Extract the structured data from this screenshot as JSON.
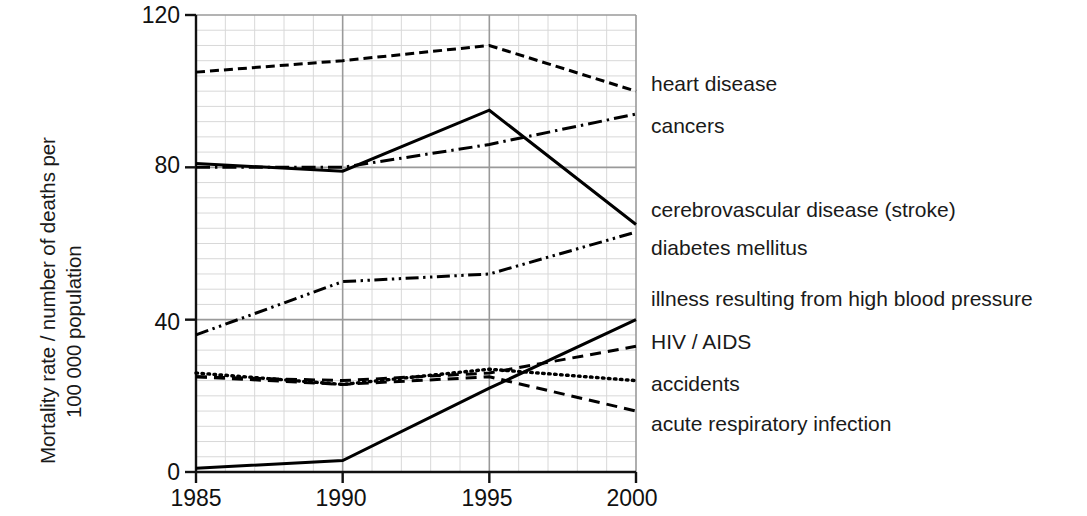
{
  "axes": {
    "ylabel_line1": "Mortality rate / number of deaths per",
    "ylabel_line2": "100 000 population",
    "ytick_0": "0",
    "ytick_40": "40",
    "ytick_80": "80",
    "ytick_120": "120",
    "xtick_1985": "1985",
    "xtick_1990": "1990",
    "xtick_1995": "1995",
    "xtick_2000": "2000"
  },
  "legend": {
    "items": [
      {
        "label": "heart disease"
      },
      {
        "label": "cancers"
      },
      {
        "label": "cerebrovascular disease (stroke)"
      },
      {
        "label": "diabetes mellitus"
      },
      {
        "label": "illness resulting from high blood pressure"
      },
      {
        "label": "HIV / AIDS"
      },
      {
        "label": "accidents"
      },
      {
        "label": "acute respiratory infection"
      }
    ]
  },
  "chart_data": {
    "type": "line",
    "title": "",
    "xlabel": "",
    "ylabel": "Mortality rate / number of deaths per 100 000 population",
    "x": [
      1985,
      1990,
      1995,
      2000
    ],
    "xlim": [
      1985,
      2000
    ],
    "ylim": [
      0,
      120
    ],
    "yticks": [
      0,
      40,
      80,
      120
    ],
    "xticks": [
      1985,
      1990,
      1995,
      2000
    ],
    "grid": "major and minor gridlines, minor every 4 units",
    "legend_position": "right, aligned to series end values",
    "line_color": "#000000",
    "series": [
      {
        "name": "heart disease",
        "style": "dashed",
        "values": [
          105,
          108,
          112,
          100
        ]
      },
      {
        "name": "cancers",
        "style": "dash-dot",
        "values": [
          80,
          80,
          86,
          94
        ]
      },
      {
        "name": "cerebrovascular disease (stroke)",
        "style": "solid",
        "values": [
          81,
          79,
          95,
          65
        ]
      },
      {
        "name": "diabetes mellitus",
        "style": "dashed-medium",
        "values": [
          25,
          23,
          25,
          16
        ]
      },
      {
        "name": "illness resulting from high blood pressure",
        "style": "dash-dot-dot",
        "values": [
          36,
          50,
          52,
          63
        ]
      },
      {
        "name": "HIV / AIDS",
        "style": "solid",
        "values": [
          1,
          3,
          22,
          40
        ]
      },
      {
        "name": "accidents",
        "style": "dotted",
        "values": [
          26,
          23,
          27,
          24
        ]
      },
      {
        "name": "acute respiratory infection",
        "style": "dashed-medium",
        "values": [
          25,
          24,
          26,
          33
        ]
      }
    ]
  }
}
